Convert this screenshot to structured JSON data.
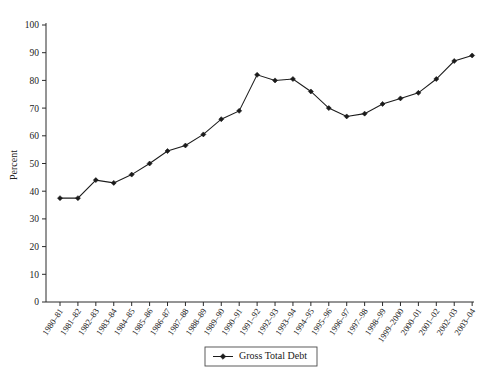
{
  "chart_data": {
    "type": "line",
    "title": "",
    "xlabel": "",
    "ylabel": "Percent",
    "ylim": [
      0,
      100
    ],
    "ytick_step": 10,
    "yticks": [
      0,
      10,
      20,
      30,
      40,
      50,
      60,
      70,
      80,
      90,
      100
    ],
    "grid": false,
    "legend_position": "bottom-center",
    "marker": "diamond",
    "line_color": "#1b1b1b",
    "marker_color": "#1b1b1b",
    "categories": [
      "1980–81",
      "1981–82",
      "1982–83",
      "1983–84",
      "1984–85",
      "1985–86",
      "1986–87",
      "1987–88",
      "1988–89",
      "1989–90",
      "1990–91",
      "1991–92",
      "1992–93",
      "1993–94",
      "1994–95",
      "1995–96",
      "1996–97",
      "1997–98",
      "1998–99",
      "1999–2000",
      "2000–01",
      "2001–02",
      "2002–03",
      "2003–04"
    ],
    "series": [
      {
        "name": "Gross Total Debt",
        "values": [
          37.5,
          37.5,
          44.0,
          43.0,
          46.0,
          50.0,
          54.5,
          56.5,
          60.5,
          66.0,
          69.0,
          82.0,
          80.0,
          80.5,
          76.0,
          70.0,
          67.0,
          68.0,
          71.5,
          73.5,
          75.5,
          80.5,
          87.0,
          89.0
        ]
      }
    ],
    "legend": [
      "Gross Total Debt"
    ]
  },
  "axes": {
    "y_axis_title": "Percent",
    "y_tick_labels": [
      "100",
      "90",
      "80",
      "70",
      "60",
      "50",
      "40",
      "30",
      "20",
      "10",
      "0"
    ]
  },
  "legend": {
    "entries": [
      {
        "label": "Gross Total Debt"
      }
    ]
  }
}
